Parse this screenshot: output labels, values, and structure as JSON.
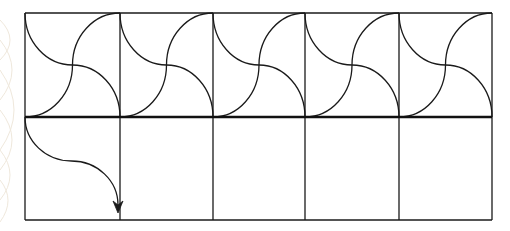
{
  "diagram": {
    "grid": {
      "x_edges": [
        25,
        120,
        213,
        305,
        399,
        492
      ],
      "top": 13,
      "divider": 117,
      "bottom": 220,
      "columns": 5,
      "rows": 2
    },
    "colors": {
      "line": "#1a1a1a",
      "divider_line": "#111111",
      "background": "#ffffff",
      "watermark": "#eee6d8"
    },
    "stroke": {
      "cell": 1.3,
      "divider": 2.6,
      "curve": 1.3
    },
    "top_row_tiles": [
      {
        "index": 1,
        "motif": "crossing-s-curves"
      },
      {
        "index": 2,
        "motif": "crossing-s-curves"
      },
      {
        "index": 3,
        "motif": "crossing-s-curves"
      },
      {
        "index": 4,
        "motif": "crossing-s-curves"
      },
      {
        "index": 5,
        "motif": "crossing-s-curves"
      }
    ],
    "bottom_row_tiles": [
      {
        "index": 1,
        "motif": "s-curve-arrow-down"
      },
      {
        "index": 2,
        "motif": "empty"
      },
      {
        "index": 3,
        "motif": "empty"
      },
      {
        "index": 4,
        "motif": "empty"
      },
      {
        "index": 5,
        "motif": "empty"
      }
    ],
    "arrow": {
      "start": [
        25,
        117
      ],
      "end": [
        118,
        213
      ],
      "direction": "down"
    }
  }
}
